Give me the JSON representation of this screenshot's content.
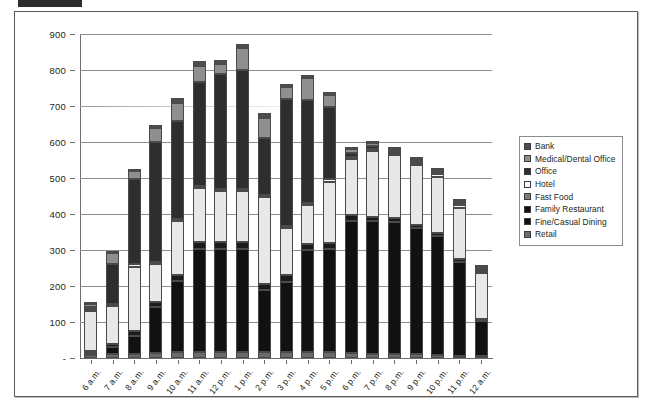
{
  "chart_data": {
    "type": "bar",
    "stacked": true,
    "title": "",
    "subtitle": "",
    "xlabel": "",
    "ylabel": "",
    "ylim": [
      0,
      900
    ],
    "ytick_values": [
      0,
      100,
      200,
      300,
      400,
      500,
      600,
      700,
      800,
      900
    ],
    "ytick_labels": [
      "-",
      "100",
      "200",
      "300",
      "400",
      "500",
      "600",
      "700",
      "800",
      "900"
    ],
    "grid": true,
    "legend_position": "right",
    "categories": [
      "6 a.m.",
      "7 a.m.",
      "8 a.m.",
      "9 a.m.",
      "10 a.m.",
      "11 a.m.",
      "12 p.m.",
      "1 p.m.",
      "2 p.m.",
      "3 p.m.",
      "4 p.m.",
      "5 p.m.",
      "6 p.m.",
      "7 p.m.",
      "8 p.m.",
      "9 p.m.",
      "10 p.m.",
      "11 p.m.",
      "12 a.m."
    ],
    "series": [
      {
        "name": "Retail",
        "color": "#6b6b6b",
        "values": [
          8,
          10,
          12,
          14,
          16,
          16,
          16,
          16,
          16,
          16,
          16,
          16,
          14,
          12,
          10,
          10,
          8,
          6,
          4
        ]
      },
      {
        "name": "Fine/Casual Dining",
        "color": "#111111",
        "values": [
          4,
          22,
          50,
          128,
          198,
          288,
          288,
          288,
          172,
          196,
          284,
          288,
          368,
          368,
          368,
          350,
          330,
          262,
          96
        ]
      },
      {
        "name": "Family Restaurant",
        "color": "#1b1b1b",
        "values": [
          6,
          8,
          12,
          14,
          16,
          18,
          18,
          18,
          18,
          18,
          16,
          16,
          14,
          12,
          10,
          10,
          8,
          6,
          4
        ]
      },
      {
        "name": "Fast Food",
        "color": "#e8e8e8",
        "values": [
          112,
          104,
          180,
          104,
          150,
          150,
          142,
          142,
          240,
          132,
          108,
          170,
          156,
          182,
          176,
          166,
          158,
          144,
          128
        ]
      },
      {
        "name": "Hotel",
        "color": "#f7f7f7",
        "values": [
          4,
          6,
          6,
          6,
          6,
          6,
          6,
          6,
          6,
          6,
          6,
          6,
          6,
          6,
          6,
          6,
          6,
          6,
          4
        ]
      },
      {
        "name": "Office",
        "color": "#2e2e2e",
        "values": [
          4,
          110,
          238,
          334,
          272,
          290,
          318,
          330,
          158,
          352,
          288,
          200,
          12,
          8,
          6,
          4,
          2,
          2,
          2
        ]
      },
      {
        "name": "Medical/Dental Office",
        "color": "#8f8f8f",
        "values": [
          8,
          32,
          22,
          40,
          50,
          44,
          30,
          60,
          58,
          34,
          60,
          36,
          10,
          10,
          6,
          4,
          2,
          2,
          2
        ]
      },
      {
        "name": "Bank",
        "color": "#4d4d4d",
        "values": [
          2,
          2,
          4,
          8,
          14,
          12,
          10,
          12,
          14,
          8,
          8,
          6,
          2,
          2,
          2,
          2,
          2,
          2,
          2
        ]
      }
    ],
    "totals": [
      148,
      294,
      524,
      648,
      722,
      824,
      828,
      872,
      682,
      762,
      786,
      738,
      582,
      600,
      584,
      552,
      516,
      430,
      242
    ]
  },
  "legend": {
    "items": [
      {
        "label": "Bank",
        "color": "#4d4d4d"
      },
      {
        "label": "Medical/Dental Office",
        "color": "#8f8f8f"
      },
      {
        "label": "Office",
        "color": "#2e2e2e"
      },
      {
        "label": "Hotel",
        "color": "#f7f7f7"
      },
      {
        "label": "Fast Food",
        "color": "#7d7d7d"
      },
      {
        "label": "Family Restaurant",
        "color": "#111111"
      },
      {
        "label": "Fine/Casual Dining",
        "color": "#111111"
      },
      {
        "label": "Retail",
        "color": "#6b6b6b"
      }
    ]
  }
}
